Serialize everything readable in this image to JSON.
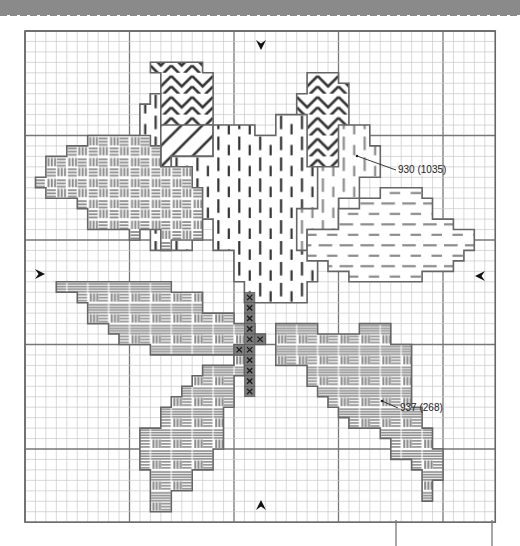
{
  "header": {
    "band_color": "#8a8a8a"
  },
  "grid": {
    "left": 25,
    "top": 31,
    "cell": 10.45,
    "cols": 45,
    "rows": 47,
    "major_every": 10,
    "minor_color": "#c8c8c8",
    "major_color": "#777777",
    "border_color": "#666666"
  },
  "colors": {
    "outline": "#666666",
    "stitch_dark": "#333333",
    "stitch_mid": "#8c8c8c",
    "stem_fill": "#7a7a7a",
    "stem_x": "#1a1a1a"
  },
  "center_markers": [
    {
      "name": "top-center-arrow",
      "dir": "down",
      "x": 261,
      "y": 45
    },
    {
      "name": "bottom-center-arrow",
      "dir": "up",
      "x": 261,
      "y": 505
    },
    {
      "name": "left-center-arrow",
      "dir": "right",
      "x": 40,
      "y": 274
    },
    {
      "name": "right-center-arrow",
      "dir": "left",
      "x": 480,
      "y": 276
    }
  ],
  "callouts": [
    {
      "name": "callout-930",
      "text": "930 (1035)",
      "label_x": 398,
      "label_y": 164,
      "from": [
        357,
        156
      ],
      "to": [
        396,
        170
      ]
    },
    {
      "name": "callout-937",
      "text": "937 (268)",
      "label_x": 400,
      "label_y": 402,
      "from": [
        382,
        401
      ],
      "to": [
        398,
        408
      ]
    }
  ],
  "regions": [
    {
      "name": "petal-top-chevron-left",
      "pattern": "chevron",
      "tone": "dark",
      "poly": [
        [
          12,
          3
        ],
        [
          17,
          3
        ],
        [
          17,
          4
        ],
        [
          18,
          4
        ],
        [
          18,
          9
        ],
        [
          17,
          9
        ],
        [
          17,
          13
        ],
        [
          13,
          13
        ],
        [
          13,
          17
        ],
        [
          12,
          17
        ],
        [
          12,
          6
        ],
        [
          13,
          6
        ],
        [
          13,
          4
        ],
        [
          12,
          4
        ]
      ]
    },
    {
      "name": "petal-top-chevron-right",
      "pattern": "chevron",
      "tone": "dark",
      "poly": [
        [
          27,
          4
        ],
        [
          30,
          4
        ],
        [
          30,
          5
        ],
        [
          31,
          5
        ],
        [
          31,
          13
        ],
        [
          30,
          13
        ],
        [
          30,
          15
        ],
        [
          27,
          15
        ],
        [
          27,
          13
        ],
        [
          26,
          13
        ],
        [
          26,
          6
        ],
        [
          27,
          6
        ]
      ]
    },
    {
      "name": "petal-left-diagonal",
      "pattern": "diagonal",
      "tone": "dark",
      "poly": [
        [
          12,
          9
        ],
        [
          18,
          9
        ],
        [
          18,
          12
        ],
        [
          14,
          12
        ],
        [
          14,
          16
        ],
        [
          13,
          16
        ],
        [
          13,
          18
        ],
        [
          12,
          18
        ]
      ]
    },
    {
      "name": "rose-center-vertical",
      "pattern": "vstitch",
      "tone": "dark",
      "poly": [
        [
          13,
          13
        ],
        [
          14,
          13
        ],
        [
          14,
          12
        ],
        [
          18,
          12
        ],
        [
          18,
          9
        ],
        [
          22,
          9
        ],
        [
          22,
          10
        ],
        [
          24,
          10
        ],
        [
          24,
          8
        ],
        [
          27,
          8
        ],
        [
          27,
          13
        ],
        [
          30,
          13
        ],
        [
          30,
          17
        ],
        [
          28,
          17
        ],
        [
          28,
          24
        ],
        [
          27,
          24
        ],
        [
          27,
          26
        ],
        [
          21,
          26
        ],
        [
          21,
          24
        ],
        [
          20,
          24
        ],
        [
          20,
          21
        ],
        [
          18,
          21
        ],
        [
          18,
          18
        ],
        [
          16,
          18
        ],
        [
          16,
          16
        ],
        [
          13,
          16
        ]
      ]
    },
    {
      "name": "rose-left-vertical",
      "pattern": "vstitch",
      "tone": "dark",
      "poly": [
        [
          12,
          6
        ],
        [
          13,
          6
        ],
        [
          13,
          17
        ],
        [
          14,
          17
        ],
        [
          14,
          18
        ],
        [
          16,
          18
        ],
        [
          16,
          21
        ],
        [
          12,
          21
        ],
        [
          12,
          15
        ],
        [
          11,
          15
        ],
        [
          11,
          7
        ],
        [
          12,
          7
        ]
      ]
    },
    {
      "name": "petal-right-vertical",
      "pattern": "vstitch",
      "tone": "mid",
      "poly": [
        [
          30,
          9
        ],
        [
          33,
          9
        ],
        [
          33,
          11
        ],
        [
          34,
          11
        ],
        [
          34,
          14
        ],
        [
          32,
          14
        ],
        [
          32,
          16
        ],
        [
          30,
          16
        ],
        [
          30,
          19
        ],
        [
          27,
          19
        ],
        [
          27,
          21
        ],
        [
          26,
          21
        ],
        [
          26,
          17
        ],
        [
          28,
          17
        ],
        [
          28,
          13
        ],
        [
          30,
          13
        ]
      ]
    },
    {
      "name": "leaf-left-top",
      "pattern": "basket",
      "tone": "mid",
      "poly": [
        [
          2,
          12
        ],
        [
          4,
          12
        ],
        [
          4,
          11
        ],
        [
          6,
          11
        ],
        [
          6,
          10
        ],
        [
          12,
          10
        ],
        [
          12,
          11
        ],
        [
          13,
          11
        ],
        [
          13,
          13
        ],
        [
          16,
          13
        ],
        [
          16,
          15
        ],
        [
          17,
          15
        ],
        [
          17,
          20
        ],
        [
          14,
          20
        ],
        [
          14,
          21
        ],
        [
          13,
          21
        ],
        [
          13,
          19
        ],
        [
          11,
          19
        ],
        [
          11,
          20
        ],
        [
          10,
          20
        ],
        [
          10,
          19
        ],
        [
          6,
          19
        ],
        [
          6,
          17
        ],
        [
          5,
          17
        ],
        [
          5,
          16
        ],
        [
          2,
          16
        ],
        [
          2,
          15
        ],
        [
          1,
          15
        ],
        [
          1,
          14
        ],
        [
          2,
          14
        ]
      ]
    },
    {
      "name": "leaf-right-horizontal",
      "pattern": "hdash",
      "tone": "mid",
      "poly": [
        [
          27,
          19
        ],
        [
          30,
          19
        ],
        [
          30,
          17
        ],
        [
          32,
          17
        ],
        [
          32,
          16
        ],
        [
          34,
          16
        ],
        [
          34,
          15
        ],
        [
          38,
          15
        ],
        [
          38,
          16
        ],
        [
          39,
          16
        ],
        [
          39,
          18
        ],
        [
          41,
          18
        ],
        [
          41,
          19
        ],
        [
          43,
          19
        ],
        [
          43,
          21
        ],
        [
          42,
          21
        ],
        [
          42,
          22
        ],
        [
          41,
          22
        ],
        [
          41,
          23
        ],
        [
          38,
          23
        ],
        [
          38,
          24
        ],
        [
          31,
          24
        ],
        [
          31,
          23
        ],
        [
          29,
          23
        ],
        [
          29,
          22
        ],
        [
          27,
          22
        ]
      ]
    },
    {
      "name": "leaf-left-middle",
      "pattern": "basket-h",
      "tone": "mid",
      "poly": [
        [
          3,
          24
        ],
        [
          14,
          24
        ],
        [
          14,
          25
        ],
        [
          17,
          25
        ],
        [
          17,
          27
        ],
        [
          20,
          27
        ],
        [
          20,
          28
        ],
        [
          22,
          28
        ],
        [
          22,
          29
        ],
        [
          23,
          29
        ],
        [
          23,
          30
        ],
        [
          20,
          30
        ],
        [
          20,
          31
        ],
        [
          12,
          31
        ],
        [
          12,
          30
        ],
        [
          9,
          30
        ],
        [
          9,
          29
        ],
        [
          8,
          29
        ],
        [
          8,
          28
        ],
        [
          6,
          28
        ],
        [
          6,
          26
        ],
        [
          5,
          26
        ],
        [
          5,
          25
        ],
        [
          3,
          25
        ]
      ]
    },
    {
      "name": "leaf-lower-right",
      "pattern": "basket-h",
      "tone": "mid",
      "poly": [
        [
          24,
          28
        ],
        [
          28,
          28
        ],
        [
          28,
          29
        ],
        [
          32,
          29
        ],
        [
          32,
          28
        ],
        [
          35,
          28
        ],
        [
          35,
          30
        ],
        [
          37,
          30
        ],
        [
          37,
          32
        ],
        [
          37,
          36
        ],
        [
          38,
          36
        ],
        [
          38,
          38
        ],
        [
          39,
          38
        ],
        [
          39,
          40
        ],
        [
          40,
          40
        ],
        [
          40,
          43
        ],
        [
          39,
          43
        ],
        [
          39,
          45
        ],
        [
          38,
          45
        ],
        [
          38,
          42
        ],
        [
          37,
          42
        ],
        [
          37,
          41
        ],
        [
          35,
          41
        ],
        [
          35,
          39
        ],
        [
          34,
          39
        ],
        [
          34,
          38
        ],
        [
          31,
          38
        ],
        [
          31,
          37
        ],
        [
          30,
          37
        ],
        [
          30,
          36
        ],
        [
          29,
          36
        ],
        [
          29,
          35
        ],
        [
          28,
          35
        ],
        [
          28,
          34
        ],
        [
          27,
          34
        ],
        [
          27,
          32
        ],
        [
          24,
          32
        ]
      ]
    },
    {
      "name": "leaf-lower-left",
      "pattern": "basket-h",
      "tone": "mid",
      "poly": [
        [
          17,
          32
        ],
        [
          20,
          32
        ],
        [
          20,
          31
        ],
        [
          21,
          31
        ],
        [
          21,
          33
        ],
        [
          20,
          33
        ],
        [
          20,
          36
        ],
        [
          19,
          36
        ],
        [
          19,
          40
        ],
        [
          18,
          40
        ],
        [
          18,
          42
        ],
        [
          16,
          42
        ],
        [
          16,
          44
        ],
        [
          14,
          44
        ],
        [
          14,
          46
        ],
        [
          12,
          46
        ],
        [
          12,
          44
        ],
        [
          12,
          42
        ],
        [
          11,
          42
        ],
        [
          11,
          38
        ],
        [
          13,
          38
        ],
        [
          13,
          36
        ],
        [
          14,
          36
        ],
        [
          14,
          35
        ],
        [
          15,
          35
        ],
        [
          15,
          34
        ],
        [
          16,
          34
        ],
        [
          16,
          33
        ],
        [
          17,
          33
        ]
      ]
    }
  ],
  "stem": {
    "name": "rose-stem",
    "cells": [
      [
        21,
        25
      ],
      [
        21,
        26
      ],
      [
        21,
        27
      ],
      [
        21,
        28
      ],
      [
        21,
        29
      ],
      [
        21,
        30
      ],
      [
        21,
        31
      ],
      [
        21,
        32
      ],
      [
        21,
        33
      ],
      [
        21,
        34
      ],
      [
        20,
        30
      ],
      [
        22,
        29
      ]
    ]
  },
  "footer": {
    "bottom_left_box": {
      "x1": 396,
      "y1": 520,
      "x2": 396,
      "y2": 546
    },
    "bottom_right_box": {
      "x1": 492,
      "y1": 520,
      "x2": 492,
      "y2": 546
    }
  }
}
